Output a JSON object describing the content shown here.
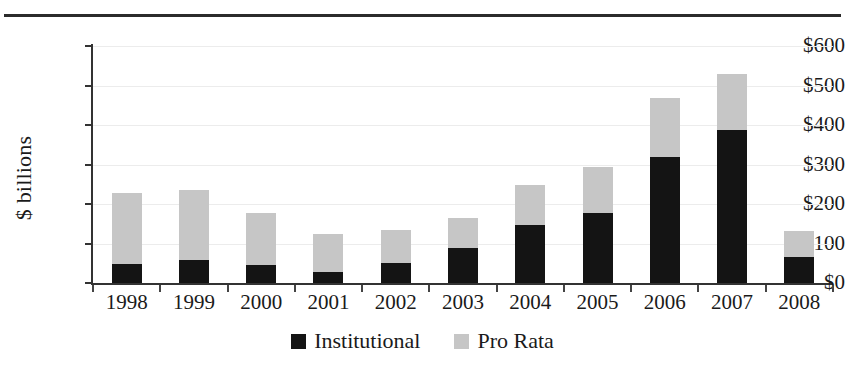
{
  "chart_data": {
    "type": "bar",
    "stacked": true,
    "title": "",
    "subtitle": "",
    "xlabel": "",
    "ylabel": "$ billions",
    "ylim": [
      0,
      600
    ],
    "ytick_values": [
      0,
      100,
      200,
      300,
      400,
      500,
      600
    ],
    "ytick_labels": [
      "$0",
      "$100",
      "$200",
      "$300",
      "$400",
      "$500",
      "$600"
    ],
    "grid": true,
    "grid_axis": "y",
    "legend_position": "bottom-center",
    "categories": [
      "1998",
      "1999",
      "2000",
      "2001",
      "2002",
      "2003",
      "2004",
      "2005",
      "2006",
      "2007",
      "2008"
    ],
    "series": [
      {
        "name": "Institutional",
        "color": "#141414",
        "values": [
          48,
          58,
          46,
          28,
          51,
          89,
          147,
          177,
          318,
          387,
          66
        ]
      },
      {
        "name": "Pro Rata",
        "color": "#c6c6c6",
        "values": [
          180,
          177,
          131,
          96,
          83,
          76,
          101,
          117,
          150,
          142,
          66
        ]
      }
    ],
    "totals": [
      228,
      235,
      177,
      124,
      134,
      165,
      248,
      294,
      468,
      529,
      132
    ]
  },
  "legend": {
    "items": [
      {
        "label": "Institutional",
        "swatch": "black-square-swatch",
        "color": "#141414"
      },
      {
        "label": "Pro Rata",
        "swatch": "gray-square-swatch",
        "color": "#c6c6c6"
      }
    ]
  },
  "decorations": {
    "top_rule": "horizontal-rule"
  }
}
